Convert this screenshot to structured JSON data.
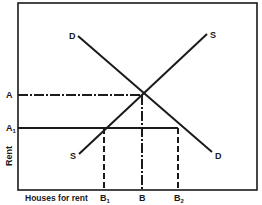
{
  "diagram": {
    "type": "supply-demand",
    "axes": {
      "x_label": "Houses for rent",
      "y_label": "Rent"
    },
    "curves": {
      "demand": {
        "label_top": "D",
        "label_bottom": "D"
      },
      "supply": {
        "label_top": "S",
        "label_bottom": "S"
      }
    },
    "y_ticks": {
      "A": "A",
      "A1_main": "A",
      "A1_sub": "1"
    },
    "x_ticks": {
      "B1_main": "B",
      "B1_sub": "1",
      "B": "B",
      "B2_main": "B",
      "B2_sub": "2"
    },
    "colors": {
      "ink": "#1a1a1a",
      "background": "#ffffff"
    }
  }
}
